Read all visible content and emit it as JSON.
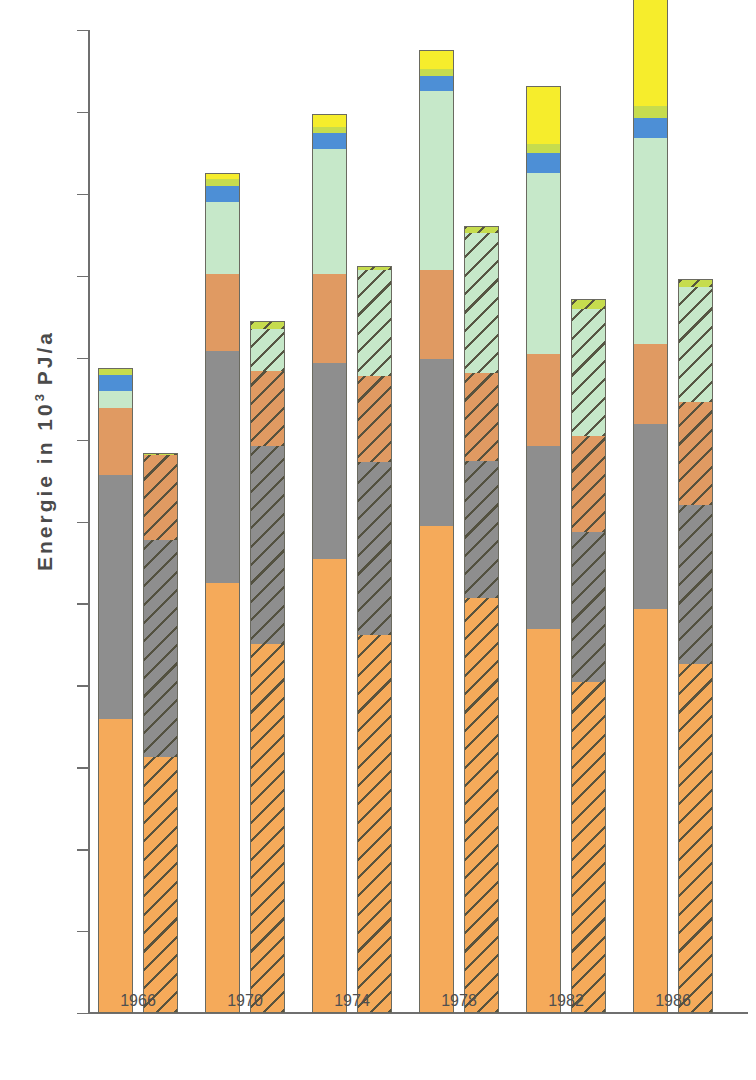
{
  "axes": {
    "ylabel_text": "Energie in 10",
    "ylabel_exp": "3",
    "ylabel_unit": " PJ/a",
    "ylabel_full": "Energie in 10^3 PJ/a",
    "yticks": [
      "0",
      "1",
      "2",
      "3",
      "4",
      "5",
      "6",
      "7",
      "8",
      "9",
      "10",
      "11",
      "12"
    ],
    "ymin": 0,
    "ymax": 12,
    "xticks": [
      "1966",
      "1970",
      "1974",
      "1978",
      "1982",
      "1986"
    ]
  },
  "colors": {
    "orange": "#F5AA5A",
    "gray": "#8E8E8E",
    "brown": "#E09A62",
    "lightgreen": "#C6E8C9",
    "blue": "#4D8FD6",
    "yellowgreen": "#C6DC4E",
    "yellow": "#F6ED2C",
    "outline": "#6A6A60",
    "axis": "#6F6F6F",
    "text": "#4F4F4F"
  },
  "chart_data": {
    "type": "bar",
    "title": "",
    "xlabel": "",
    "ylabel": "Energie in 10^3 PJ/a",
    "ylim": [
      0,
      12
    ],
    "grid": false,
    "legend": "none",
    "stacked": true,
    "grouped_pairs": true,
    "categories": [
      "1966",
      "1970",
      "1974",
      "1978",
      "1982",
      "1986"
    ],
    "segment_names": [
      "orange",
      "gray",
      "brown",
      "lightgreen",
      "blue",
      "yellowgreen",
      "yellow"
    ],
    "series": [
      {
        "name": "orange",
        "fill": "solid",
        "left_values": [
          3.6,
          5.26,
          5.55,
          5.96,
          4.7,
          4.95
        ],
        "right_values": [
          3.14,
          4.52,
          4.63,
          5.08,
          4.05,
          4.27
        ]
      },
      {
        "name": "gray",
        "fill": "solid",
        "left_values": [
          3.0,
          2.85,
          2.41,
          2.05,
          2.25,
          2.27
        ],
        "right_values": [
          2.66,
          2.43,
          2.12,
          1.69,
          1.85,
          1.96
        ]
      },
      {
        "name": "brown",
        "fill": "solid",
        "left_values": [
          0.83,
          0.95,
          1.1,
          1.1,
          1.13,
          0.99
        ],
        "right_values": [
          1.05,
          0.93,
          1.07,
          1.08,
          1.18,
          1.27
        ]
      },
      {
        "name": "lightgreen",
        "fill": "solid",
        "left_values": [
          0.22,
          0.9,
          1.54,
          2.2,
          2.23,
          2.53
        ],
        "right_values": [
          0.02,
          0.53,
          1.3,
          1.73,
          1.57,
          1.42
        ]
      },
      {
        "name": "blue",
        "fill": "solid",
        "left_values": [
          0.2,
          0.2,
          0.21,
          0.2,
          0.25,
          0.25
        ],
        "right_values": [
          0.0,
          0.0,
          0.0,
          0.0,
          0.0,
          0.0
        ]
      },
      {
        "name": "yellowgreen",
        "fill": "solid",
        "left_values": [
          0.09,
          0.1,
          0.09,
          0.1,
          0.13,
          0.16
        ],
        "right_values": [
          0.02,
          0.09,
          0.05,
          0.08,
          0.12,
          0.09
        ]
      },
      {
        "name": "yellow",
        "fill": "solid",
        "left_values": [
          0.0,
          0.08,
          0.16,
          0.23,
          0.71,
          1.31
        ],
        "right_values": [
          0.0,
          0.0,
          0.0,
          0.0,
          0.0,
          0.0
        ]
      }
    ],
    "totals": {
      "left": [
        7.94,
        10.0,
        10.85,
        11.52,
        10.71,
        11.47
      ],
      "right": [
        6.89,
        8.5,
        9.17,
        9.66,
        8.77,
        9.01
      ]
    }
  }
}
